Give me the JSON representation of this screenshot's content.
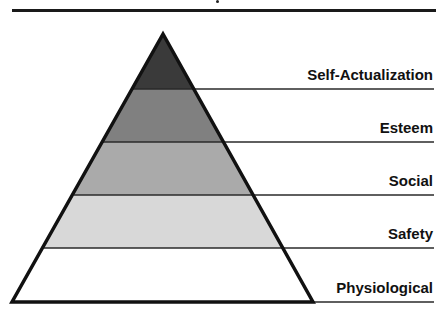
{
  "diagram": {
    "type": "pyramid",
    "levels": [
      {
        "label": "Self-Actualization",
        "color": "#3a3a3a"
      },
      {
        "label": "Esteem",
        "color": "#808080"
      },
      {
        "label": "Social",
        "color": "#aaaaaa"
      },
      {
        "label": "Safety",
        "color": "#d8d8d8"
      },
      {
        "label": "Physiological",
        "color": "#ffffff"
      }
    ],
    "outline_color": "#111111",
    "divider_color": "#333333"
  }
}
